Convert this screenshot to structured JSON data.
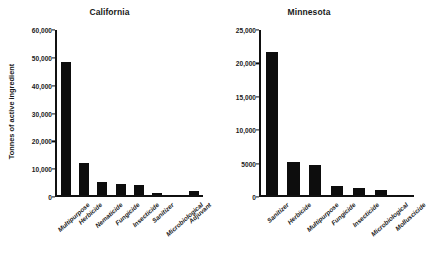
{
  "chart_data": [
    {
      "type": "bar",
      "title": "California",
      "xlabel": "",
      "ylabel": "Tonnes of active ingredient",
      "ylim": [
        0,
        60000
      ],
      "yticks": [
        0,
        10000,
        20000,
        30000,
        40000,
        50000,
        60000
      ],
      "ytick_labels": [
        "0",
        "10,000",
        "20,000",
        "30,000",
        "40,000",
        "50,000",
        "60,000"
      ],
      "grid": false,
      "legend": "none",
      "bar_color": "#0d0d0d",
      "categories": [
        "Multipurpose",
        "Herbicide",
        "Nematicide",
        "Fungicide",
        "Insecticide",
        "Sanitizer",
        "Microbiological",
        "Adjuvant"
      ],
      "values": [
        48000,
        11500,
        4700,
        4000,
        3900,
        800,
        150,
        1700
      ]
    },
    {
      "type": "bar",
      "title": "Minnesota",
      "xlabel": "",
      "ylabel": "",
      "ylim": [
        0,
        25000
      ],
      "yticks": [
        0,
        5000,
        10000,
        15000,
        20000,
        25000
      ],
      "ytick_labels": [
        "0",
        "5000",
        "10,000",
        "15,000",
        "20,000",
        "25,000"
      ],
      "grid": false,
      "legend": "none",
      "bar_color": "#0d0d0d",
      "categories": [
        "Sanitizer",
        "Herbicide",
        "Multipurpose",
        "Fungicide",
        "Insecticide",
        "Microbiological",
        "Molluscicide"
      ],
      "values": [
        21500,
        5000,
        4500,
        1400,
        1100,
        800,
        50
      ]
    }
  ]
}
